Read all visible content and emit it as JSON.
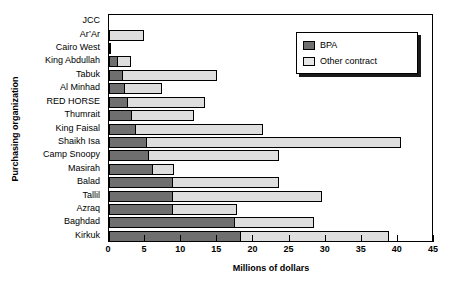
{
  "chart_data": {
    "type": "bar",
    "orientation": "horizontal",
    "stacked": true,
    "title": "",
    "xlabel": "Millions of dollars",
    "ylabel": "Purchasing organization",
    "xlim": [
      0,
      45
    ],
    "xticks": [
      0,
      5,
      10,
      15,
      20,
      25,
      30,
      35,
      40,
      45
    ],
    "grid": false,
    "legend_position": "top-right",
    "categories": [
      "JCC",
      "Ar’Ar",
      "Cairo West",
      "King Abdullah",
      "Tabuk",
      "Al Minhad",
      "RED HORSE",
      "Thumrait",
      "King Faisal",
      "Shaikh Isa",
      "Camp Snoopy",
      "Masirah",
      "Balad",
      "Tallil",
      "Azraq",
      "Baghdad",
      "Kirkuk"
    ],
    "series": [
      {
        "name": "BPA",
        "color": "#6f6f6f",
        "values": [
          0,
          0,
          0.3,
          1.3,
          2.0,
          2.2,
          2.6,
          3.2,
          3.8,
          5.2,
          5.6,
          6.1,
          8.8,
          8.8,
          8.8,
          17.4,
          18.3
        ]
      },
      {
        "name": "Other contract",
        "color": "#dedede",
        "values": [
          0,
          4.9,
          0,
          1.7,
          13.0,
          5.1,
          10.7,
          8.6,
          17.5,
          35.2,
          17.9,
          2.9,
          14.7,
          20.7,
          8.9,
          11.0,
          20.5
        ]
      }
    ],
    "totals": [
      0,
      4.9,
      0.3,
      3.0,
      15.0,
      7.3,
      13.3,
      11.8,
      21.3,
      40.4,
      23.5,
      9.0,
      23.5,
      29.5,
      17.7,
      28.4,
      38.8
    ]
  },
  "legend": {
    "items": [
      {
        "label": "BPA",
        "swatch": "dark-gray-swatch"
      },
      {
        "label": "Other contract",
        "swatch": "light-gray-swatch"
      }
    ]
  },
  "axis": {
    "x_title": "Millions of dollars",
    "y_title": "Purchasing organization"
  }
}
